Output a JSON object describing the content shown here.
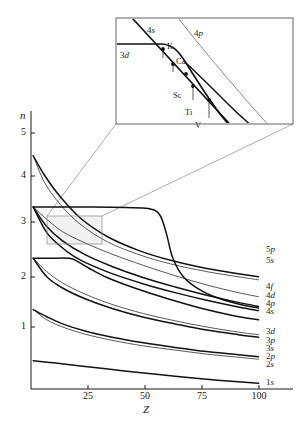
{
  "figure": {
    "kind": "orbital-energy-level-diagram"
  },
  "axes": {
    "y_label": "n",
    "x_label": "Z",
    "y_ticks": [
      {
        "value": "5",
        "y": 133
      },
      {
        "value": "4",
        "y": 176
      },
      {
        "value": "3",
        "y": 222
      },
      {
        "value": "2",
        "y": 277
      },
      {
        "value": "1",
        "y": 327
      }
    ],
    "x_ticks": [
      {
        "value": "25",
        "x": 88
      },
      {
        "value": "50",
        "x": 145
      },
      {
        "value": "75",
        "x": 202
      },
      {
        "value": "100",
        "x": 259
      }
    ],
    "xlim": [
      0,
      103
    ],
    "ylim": [
      0.45,
      5.6
    ],
    "grid": false
  },
  "curve_labels": [
    {
      "text": "5p",
      "n": "5",
      "l": "p",
      "y": 250
    },
    {
      "text": "5s",
      "n": "5",
      "l": "s",
      "y": 261
    },
    {
      "text": "4f",
      "n": "4",
      "l": "f",
      "y": 287
    },
    {
      "text": "4d",
      "n": "4",
      "l": "d",
      "y": 296
    },
    {
      "text": "4p",
      "n": "4",
      "l": "p",
      "y": 304
    },
    {
      "text": "4s",
      "n": "4",
      "l": "s",
      "y": 312
    },
    {
      "text": "3d",
      "n": "3",
      "l": "d",
      "y": 332
    },
    {
      "text": "3p",
      "n": "3",
      "l": "p",
      "y": 341
    },
    {
      "text": "3s",
      "n": "3",
      "l": "s",
      "y": 349
    },
    {
      "text": "2p",
      "n": "2",
      "l": "p",
      "y": 357
    },
    {
      "text": "2s",
      "n": "2",
      "l": "s",
      "y": 365
    },
    {
      "text": "1s",
      "n": "1",
      "l": "s",
      "y": 383
    }
  ],
  "inset": {
    "box": {
      "x": 116,
      "y": 18,
      "width": 177,
      "height": 106
    },
    "curve_labels": [
      {
        "text": "4s",
        "n": "4",
        "l": "s",
        "x": 147,
        "y": 26
      },
      {
        "text": "4p",
        "n": "4",
        "l": "p",
        "x": 194,
        "y": 29
      },
      {
        "text": "3d",
        "n": "3",
        "l": "d",
        "x": 120,
        "y": 51
      }
    ],
    "element_labels": [
      {
        "text": "K",
        "x": 167,
        "y": 42
      },
      {
        "text": "Ca",
        "x": 176,
        "y": 57
      },
      {
        "text": "Sc",
        "x": 173,
        "y": 91
      },
      {
        "text": "Ti",
        "x": 185,
        "y": 108
      },
      {
        "text": "V",
        "x": 195,
        "y": 121
      }
    ],
    "source_region": {
      "x": 47,
      "y": 216,
      "width": 55,
      "height": 28
    }
  },
  "chart_data": {
    "type": "line",
    "title": "",
    "xlabel": "Z",
    "ylabel": "n",
    "xlim": [
      0,
      103
    ],
    "ylim": [
      0.45,
      5.6
    ],
    "grid": false,
    "legend_position": "right-inline",
    "note": "n is the effective principal quantum number; each series is one atomic orbital traced across the periodic table",
    "series": [
      {
        "name": "5p",
        "points": [
          [
            1,
            5.0
          ],
          [
            6,
            4.62
          ],
          [
            13,
            4.2
          ],
          [
            22,
            3.78
          ],
          [
            34,
            3.42
          ],
          [
            48,
            3.15
          ],
          [
            62,
            2.96
          ],
          [
            78,
            2.8
          ],
          [
            92,
            2.7
          ],
          [
            101,
            2.64
          ]
        ]
      },
      {
        "name": "5s",
        "points": [
          [
            1,
            5.0
          ],
          [
            6,
            4.48
          ],
          [
            13,
            4.05
          ],
          [
            22,
            3.66
          ],
          [
            34,
            3.32
          ],
          [
            48,
            3.07
          ],
          [
            62,
            2.89
          ],
          [
            78,
            2.74
          ],
          [
            92,
            2.64
          ],
          [
            101,
            2.58
          ]
        ]
      },
      {
        "name": "4f",
        "points": [
          [
            1,
            4.0
          ],
          [
            14,
            4.0
          ],
          [
            28,
            4.0
          ],
          [
            42,
            3.99
          ],
          [
            52,
            3.97
          ],
          [
            57,
            3.86
          ],
          [
            60,
            3.5
          ],
          [
            63,
            3.0
          ],
          [
            68,
            2.62
          ],
          [
            76,
            2.36
          ],
          [
            86,
            2.18
          ],
          [
            95,
            2.08
          ],
          [
            101,
            2.03
          ]
        ]
      },
      {
        "name": "4d",
        "points": [
          [
            1,
            4.0
          ],
          [
            7,
            3.76
          ],
          [
            14,
            3.52
          ],
          [
            24,
            3.3
          ],
          [
            36,
            3.08
          ],
          [
            50,
            2.86
          ],
          [
            64,
            2.66
          ],
          [
            78,
            2.48
          ],
          [
            92,
            2.33
          ],
          [
            101,
            2.25
          ]
        ]
      },
      {
        "name": "4p",
        "points": [
          [
            1,
            4.0
          ],
          [
            7,
            3.62
          ],
          [
            14,
            3.34
          ],
          [
            24,
            3.07
          ],
          [
            36,
            2.84
          ],
          [
            50,
            2.62
          ],
          [
            64,
            2.44
          ],
          [
            78,
            2.28
          ],
          [
            92,
            2.14
          ],
          [
            101,
            2.06
          ]
        ]
      },
      {
        "name": "4s",
        "points": [
          [
            1,
            4.0
          ],
          [
            7,
            3.5
          ],
          [
            14,
            3.2
          ],
          [
            19,
            3.04
          ],
          [
            24,
            2.92
          ],
          [
            36,
            2.7
          ],
          [
            50,
            2.5
          ],
          [
            64,
            2.33
          ],
          [
            78,
            2.18
          ],
          [
            92,
            2.05
          ],
          [
            101,
            1.98
          ]
        ]
      },
      {
        "name": "3d",
        "points": [
          [
            1,
            3.0
          ],
          [
            8,
            3.0
          ],
          [
            17,
            3.0
          ],
          [
            21,
            2.93
          ],
          [
            26,
            2.8
          ],
          [
            34,
            2.62
          ],
          [
            46,
            2.42
          ],
          [
            60,
            2.22
          ],
          [
            76,
            2.02
          ],
          [
            90,
            1.88
          ],
          [
            101,
            1.8
          ]
        ]
      },
      {
        "name": "3p",
        "points": [
          [
            1,
            3.0
          ],
          [
            7,
            2.74
          ],
          [
            14,
            2.52
          ],
          [
            24,
            2.3
          ],
          [
            36,
            2.1
          ],
          [
            50,
            1.92
          ],
          [
            64,
            1.78
          ],
          [
            78,
            1.66
          ],
          [
            92,
            1.56
          ],
          [
            101,
            1.51
          ]
        ]
      },
      {
        "name": "3s",
        "points": [
          [
            1,
            3.0
          ],
          [
            7,
            2.64
          ],
          [
            14,
            2.42
          ],
          [
            24,
            2.21
          ],
          [
            36,
            2.02
          ],
          [
            50,
            1.85
          ],
          [
            64,
            1.72
          ],
          [
            78,
            1.6
          ],
          [
            92,
            1.51
          ],
          [
            101,
            1.46
          ]
        ]
      },
      {
        "name": "2p",
        "points": [
          [
            1,
            2.0
          ],
          [
            7,
            1.86
          ],
          [
            14,
            1.72
          ],
          [
            24,
            1.58
          ],
          [
            36,
            1.46
          ],
          [
            50,
            1.35
          ],
          [
            64,
            1.26
          ],
          [
            78,
            1.18
          ],
          [
            92,
            1.12
          ],
          [
            101,
            1.08
          ]
        ]
      },
      {
        "name": "2s",
        "points": [
          [
            1,
            2.0
          ],
          [
            7,
            1.8
          ],
          [
            14,
            1.66
          ],
          [
            24,
            1.52
          ],
          [
            36,
            1.4
          ],
          [
            50,
            1.29
          ],
          [
            64,
            1.21
          ],
          [
            78,
            1.13
          ],
          [
            92,
            1.07
          ],
          [
            101,
            1.03
          ]
        ]
      },
      {
        "name": "1s",
        "points": [
          [
            1,
            1.0
          ],
          [
            10,
            0.96
          ],
          [
            22,
            0.9
          ],
          [
            36,
            0.83
          ],
          [
            50,
            0.76
          ],
          [
            64,
            0.7
          ],
          [
            78,
            0.64
          ],
          [
            92,
            0.59
          ],
          [
            101,
            0.56
          ]
        ]
      }
    ]
  }
}
